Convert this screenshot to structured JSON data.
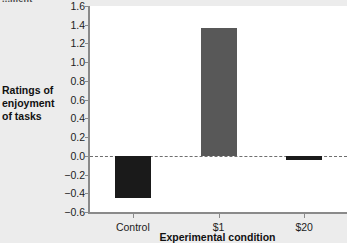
{
  "figure": {
    "cropped_caption": "...ment",
    "background_color": "#ececec",
    "plot_background_color": "#ffffff",
    "axis_color": "#8a8a8a",
    "zero_line_color": "#6e6e6e"
  },
  "chart_data": {
    "type": "bar",
    "title": "",
    "xlabel": "Experimental condition",
    "ylabel": "Ratings of enjoyment of tasks",
    "ylabel_lines": [
      "Ratings of",
      "enjoyment",
      "of tasks"
    ],
    "categories": [
      "Control",
      "$1",
      "$20"
    ],
    "values": [
      -0.45,
      1.36,
      -0.05
    ],
    "bar_colors": [
      "#1a1a1a",
      "#585858",
      "#1a1a1a"
    ],
    "ylim": [
      -0.6,
      1.6
    ],
    "ytick_values": [
      1.6,
      1.4,
      1.2,
      1.0,
      0.8,
      0.6,
      0.4,
      0.2,
      0.0,
      -0.2,
      -0.4,
      -0.6
    ],
    "ytick_labels": [
      "1.6",
      "1.4",
      "1.2",
      "1.0",
      "0.8",
      "0.6",
      "0.4",
      "0.2",
      "0.0",
      "−0.2",
      "−0.4",
      "−0.6"
    ],
    "grid": false,
    "legend": "none",
    "zero_reference_line": 0.0
  }
}
